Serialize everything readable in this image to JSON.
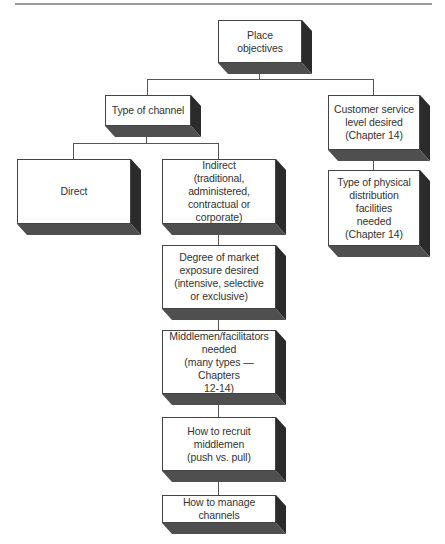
{
  "diagram": {
    "title": "",
    "nodes": [
      {
        "id": "place_objectives",
        "label": "Place\nobjectives",
        "x": 218,
        "y": 20,
        "w": 84,
        "h": 43
      },
      {
        "id": "type_of_channel",
        "label": "Type of channel",
        "x": 105,
        "y": 95,
        "w": 86,
        "h": 31
      },
      {
        "id": "customer_service",
        "label": "Customer service\nlevel desired\n(Chapter 14)",
        "x": 328,
        "y": 95,
        "w": 92,
        "h": 55
      },
      {
        "id": "physical_distribution",
        "label": "Type of physical\ndistribution\nfacilities\nneeded\n(Chapter 14)",
        "x": 328,
        "y": 170,
        "w": 92,
        "h": 76
      },
      {
        "id": "direct",
        "label": "Direct",
        "x": 17,
        "y": 159,
        "w": 114,
        "h": 65
      },
      {
        "id": "indirect",
        "label": "Indirect\n(traditional,\nadministered,\ncontractual or corporate)",
        "x": 162,
        "y": 159,
        "w": 114,
        "h": 65
      },
      {
        "id": "market_exposure",
        "label": "Degree of market\nexposure desired\n(intensive, selective\nor exclusive)",
        "x": 162,
        "y": 245,
        "w": 114,
        "h": 64
      },
      {
        "id": "middlemen_needed",
        "label": "Middlemen/facilitators\nneeded\n(many types — Chapters\n12-14)",
        "x": 162,
        "y": 330,
        "w": 114,
        "h": 64
      },
      {
        "id": "recruit_middlemen",
        "label": "How to recruit\nmiddlemen\n(push vs. pull)",
        "x": 162,
        "y": 417,
        "w": 114,
        "h": 54
      },
      {
        "id": "manage_channels",
        "label": "How to manage channels",
        "x": 162,
        "y": 495,
        "w": 114,
        "h": 28
      }
    ],
    "edges": [
      {
        "from": "place_objectives",
        "to": "type_of_channel"
      },
      {
        "from": "place_objectives",
        "to": "customer_service"
      },
      {
        "from": "type_of_channel",
        "to": "direct"
      },
      {
        "from": "type_of_channel",
        "to": "indirect"
      },
      {
        "from": "customer_service",
        "to": "physical_distribution"
      },
      {
        "from": "indirect",
        "to": "market_exposure"
      },
      {
        "from": "market_exposure",
        "to": "middlemen_needed"
      },
      {
        "from": "middlemen_needed",
        "to": "recruit_middlemen"
      },
      {
        "from": "recruit_middlemen",
        "to": "manage_channels"
      }
    ],
    "colors": {
      "face": "#ffffff",
      "border": "#444444",
      "side": "#2b2b2b",
      "bottom": "#4f4f4f",
      "line": "#555555",
      "rule": "#9a9a9a"
    }
  }
}
